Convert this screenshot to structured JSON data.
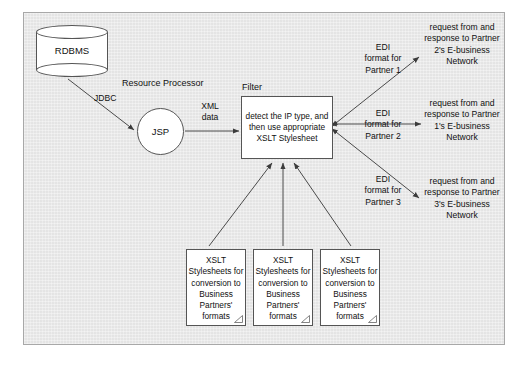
{
  "diagram": {
    "colors": {
      "canvas_background": "#e9e9e9",
      "page_background": "#ffffff",
      "node_fill": "#ffffff",
      "stroke": "#555555",
      "frame_border": "#a8a8a8",
      "text": "#111111"
    },
    "nodes": {
      "database": {
        "label": "RDBMS",
        "shape": "cylinder"
      },
      "processor": {
        "label": "JSP",
        "shape": "circle",
        "caption": "Resource Processor"
      },
      "filter": {
        "caption": "Filter",
        "shape": "rectangle",
        "label": "detect the IP type, and then use appropriate XSLT Stylesheet"
      },
      "stylesheet_docs": [
        {
          "label": "XSLT Stylesheets for conversion to Business Partners' formats",
          "shape": "document"
        },
        {
          "label": "XSLT Stylesheets for conversion to Business Partners' formats",
          "shape": "document"
        },
        {
          "label": "XSLT Stylesheets for conversion to Business Partners' formats",
          "shape": "document"
        }
      ]
    },
    "edge_labels": {
      "db_to_jsp": "JDBC",
      "jsp_to_filter": "XML\ndata",
      "edi_1": "EDI\nformat for\nPartner 1",
      "edi_2": "EDI\nformat for\nPartner 2",
      "edi_3": "EDI\nformat for\nPartner 3"
    },
    "networks": [
      {
        "label": "request from and response to Partner 2's E-business Network"
      },
      {
        "label": "request from and response to Partner 1's E-business Network"
      },
      {
        "label": "request from and response to Partner 3's E-business Network"
      }
    ]
  }
}
